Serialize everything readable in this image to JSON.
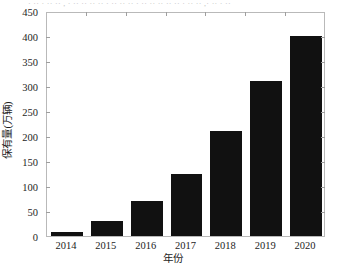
{
  "figure": {
    "cropped_caption_fragment": "· ·· · ·· ·· , · ·· ·· ·· ·· · ·· ·· ·· · ·· ·· ·· ·· ·· · ·· ·· ,· ·· · ··",
    "background_color": "#ffffff",
    "frame_color": "#b9b9b9"
  },
  "chart_data": {
    "type": "bar",
    "title": "",
    "subtitle": "",
    "categories": [
      "2014",
      "2015",
      "2016",
      "2017",
      "2018",
      "2019",
      "2020"
    ],
    "values": [
      8,
      30,
      70,
      125,
      210,
      310,
      400
    ],
    "xlabel": "年份",
    "ylabel": "保有量(万辆)",
    "ylim": [
      0,
      450
    ],
    "ytick_labels": [
      "0",
      "50",
      "100",
      "150",
      "200",
      "250",
      "300",
      "350",
      "400",
      "450"
    ],
    "ytick_values": [
      0,
      50,
      100,
      150,
      200,
      250,
      300,
      350,
      400,
      450
    ],
    "ytick_step": 50,
    "xtick_labels": [
      "2014",
      "2015",
      "2016",
      "2017",
      "2018",
      "2019",
      "2020"
    ],
    "bar_color": "#111111",
    "grid": false,
    "legend": null,
    "legend_position": "none",
    "annotations": [],
    "axis_ticks_inward": true,
    "ticks_on_right_axis": true
  }
}
